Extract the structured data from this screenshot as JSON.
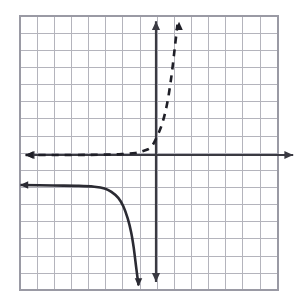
{
  "figure": {
    "name": "exponential-function-and-transformed-reflection-graph",
    "background_color": "#ffffff",
    "width": 308,
    "height": 307
  },
  "colors": {
    "grid_minor": "#b4b4bc",
    "grid_major": "#9a9aa4",
    "axis": "#3a3a42",
    "curve_solid": "#2b2b33",
    "curve_dashed": "#1f1f27",
    "plot_background": "#ffffff"
  },
  "chart_data": {
    "type": "line",
    "title": "",
    "subtitle": "",
    "xlabel": "",
    "ylabel": "",
    "grid": true,
    "grid_spacing_units": 1,
    "legend_position": "none",
    "axes": {
      "x_axis": {
        "label": "",
        "visible": true,
        "arrows": [
          "left",
          "right"
        ],
        "position_value": 0,
        "range_units": [
          -7.6,
          8.0
        ],
        "tick_labels": []
      },
      "y_axis": {
        "label": "",
        "visible": true,
        "arrows": [
          "up",
          "down"
        ],
        "position_value": 0,
        "range_units": [
          -7.4,
          7.8
        ],
        "tick_labels": []
      }
    },
    "grid_pixels": {
      "left": 20,
      "top": 16,
      "right": 278,
      "bottom": 290,
      "cell_size": 17.15,
      "columns": 15,
      "rows": 16,
      "origin_x_px": 156,
      "origin_y_px": 155
    },
    "series": [
      {
        "name": "dashed-exponential-curve",
        "style": "dashed",
        "color": "#1f1f27",
        "line_width": 2.6,
        "dash_pattern": "7 6",
        "description": "Increasing exponential-type curve with horizontal asymptote y=0 on the left and vertical asymptote x=1.3 on the right; arrow pointing up at the top",
        "asymptotes": {
          "horizontal": 0,
          "vertical": 1.3
        },
        "arrow_ends": [
          "left-along-x-axis",
          "up"
        ],
        "points": [
          {
            "x": -7.6,
            "y": 0.0
          },
          {
            "x": -5.0,
            "y": 0.0
          },
          {
            "x": -3.0,
            "y": 0.02
          },
          {
            "x": -2.0,
            "y": 0.05
          },
          {
            "x": -1.2,
            "y": 0.12
          },
          {
            "x": -0.7,
            "y": 0.25
          },
          {
            "x": -0.3,
            "y": 0.45
          },
          {
            "x": 0.0,
            "y": 0.95
          },
          {
            "x": 0.35,
            "y": 1.8
          },
          {
            "x": 0.65,
            "y": 3.0
          },
          {
            "x": 0.9,
            "y": 4.6
          },
          {
            "x": 1.1,
            "y": 6.3
          },
          {
            "x": 1.25,
            "y": 7.6
          }
        ]
      },
      {
        "name": "solid-reflected-curve",
        "style": "solid",
        "color": "#2b2b33",
        "line_width": 2.6,
        "description": "Decreasing curve in the third quadrant with horizontal asymptote y=-1.8 on the left and vertical asymptote x=-1.0 falling to negative infinity; arrow pointing left and arrow pointing down",
        "asymptotes": {
          "horizontal": -1.8,
          "vertical": -1.0
        },
        "arrow_ends": [
          "left",
          "down"
        ],
        "points": [
          {
            "x": -7.9,
            "y": -1.75
          },
          {
            "x": -6.0,
            "y": -1.78
          },
          {
            "x": -4.5,
            "y": -1.8
          },
          {
            "x": -3.6,
            "y": -1.85
          },
          {
            "x": -3.0,
            "y": -1.95
          },
          {
            "x": -2.6,
            "y": -2.15
          },
          {
            "x": -2.2,
            "y": -2.5
          },
          {
            "x": -1.9,
            "y": -3.0
          },
          {
            "x": -1.65,
            "y": -3.7
          },
          {
            "x": -1.45,
            "y": -4.5
          },
          {
            "x": -1.3,
            "y": -5.4
          },
          {
            "x": -1.15,
            "y": -6.6
          },
          {
            "x": -1.02,
            "y": -7.6
          }
        ]
      }
    ],
    "annotations": []
  }
}
